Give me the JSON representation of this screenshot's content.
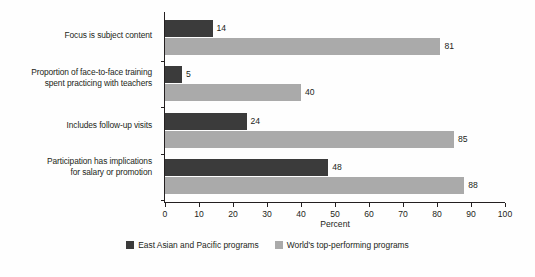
{
  "chart_data": {
    "type": "bar",
    "orientation": "horizontal",
    "title": "",
    "subtitle": "",
    "xlabel": "Percent",
    "ylabel": "",
    "xlim": [
      0,
      100
    ],
    "xticks": [
      0,
      10,
      20,
      30,
      40,
      50,
      60,
      70,
      80,
      90,
      100
    ],
    "xtick_labels": [
      "0",
      "10",
      "20",
      "30",
      "40",
      "50",
      "60",
      "70",
      "80",
      "90",
      "100"
    ],
    "grid": false,
    "legend_position": "bottom-center",
    "categories": [
      "Focus is subject content",
      "Proportion of face-to-face training spent practicing with teachers",
      "Includes follow-up visits",
      "Participation has implications for salary or promotion"
    ],
    "category_lines": [
      [
        "Focus is subject content"
      ],
      [
        "Proportion of face-to-face training",
        "spent practicing with teachers"
      ],
      [
        "Includes follow-up visits"
      ],
      [
        "Participation has implications",
        "for salary or promotion"
      ]
    ],
    "series": [
      {
        "name": "East Asian and Pacific programs",
        "color": "#3b3b3b",
        "values": [
          14,
          5,
          24,
          48
        ],
        "value_labels": [
          "14",
          "5",
          "24",
          "48"
        ]
      },
      {
        "name": "World's top-performing programs",
        "color": "#aaaaaa",
        "values": [
          81,
          40,
          85,
          88
        ],
        "value_labels": [
          "81",
          "40",
          "85",
          "88"
        ]
      }
    ]
  },
  "legend": {
    "items": [
      {
        "label": "East Asian and Pacific programs",
        "swatch": "dark"
      },
      {
        "label": "World's top-performing programs",
        "swatch": "light"
      }
    ]
  },
  "axis": {
    "x_title": "Percent"
  }
}
